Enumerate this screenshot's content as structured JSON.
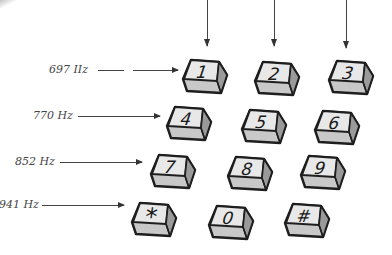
{
  "diagram": {
    "type": "dtmf-keypad",
    "row_frequencies": [
      {
        "label": "697 IIz",
        "row": 0
      },
      {
        "label": "770 Hz",
        "row": 1
      },
      {
        "label": "852 Hz",
        "row": 2
      },
      {
        "label": "941 Hz",
        "row": 3
      }
    ],
    "column_arrows": 3,
    "keys": [
      [
        "1",
        "2",
        "3"
      ],
      [
        "4",
        "5",
        "6"
      ],
      [
        "7",
        "8",
        "9"
      ],
      [
        "*",
        "0",
        "#"
      ]
    ]
  },
  "colors": {
    "key_top": "#e6e6e6",
    "key_front": "#c8c8c8",
    "key_side": "#9a9a9a",
    "outline": "#1e1e1e",
    "arrow": "#444444",
    "label": "#444444"
  }
}
